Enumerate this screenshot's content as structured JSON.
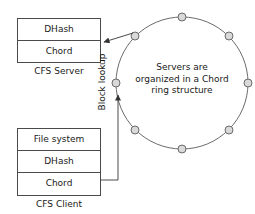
{
  "diagram": {
    "server_box": {
      "caption": "CFS Server",
      "layers": [
        "DHash",
        "Chord"
      ]
    },
    "client_box": {
      "caption": "CFS Client",
      "layers": [
        "File system",
        "DHash",
        "Chord"
      ]
    },
    "ring": {
      "annotation_lines": [
        "Servers are",
        "organized in a Chord",
        "ring structure"
      ],
      "node_count": 8,
      "center": {
        "x": 182,
        "y": 83
      },
      "radius": 66,
      "nodes": [
        {
          "id": "node-top",
          "x": 182,
          "y": 17
        },
        {
          "id": "node-upper-right",
          "x": 229,
          "y": 36
        },
        {
          "id": "node-right",
          "x": 248,
          "y": 83
        },
        {
          "id": "node-lower-right",
          "x": 229,
          "y": 130
        },
        {
          "id": "node-bottom",
          "x": 182,
          "y": 149
        },
        {
          "id": "node-lower-left",
          "x": 135,
          "y": 130
        },
        {
          "id": "node-left",
          "x": 116,
          "y": 83
        },
        {
          "id": "node-upper-left",
          "x": 135,
          "y": 36
        }
      ],
      "node_fill": "#d9d9d9",
      "node_stroke": "#6b6b6b",
      "ring_stroke": "#6b6b6b"
    },
    "connectors": {
      "block_lookup_label": "Block lookup",
      "line_stroke": "#4a4a4a"
    },
    "colors": {
      "background": "#ffffff",
      "text": "#1a1a1a",
      "box_border": "#4a4a4a"
    }
  }
}
